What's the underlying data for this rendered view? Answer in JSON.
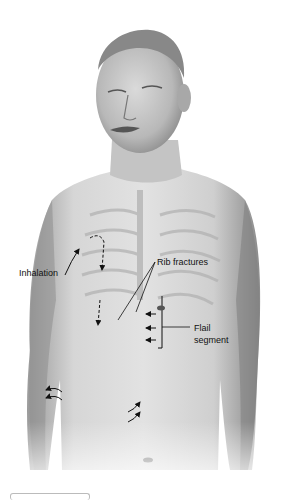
{
  "figure": {
    "labels": {
      "inhalation": "Inhalation",
      "rib_fractures": "Rib fractures",
      "flail_segment_line1": "Flail",
      "flail_segment_line2": "segment"
    }
  }
}
